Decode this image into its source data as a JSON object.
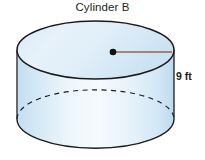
{
  "figure": {
    "title": "Cylinder B",
    "shape": "cylinder",
    "height_label": "9 ft",
    "radius_line": "radius segment from center of top face to edge",
    "colors": {
      "top_face_fill": "#e4f1f9",
      "body_fill_light": "#f2f9fd",
      "body_fill_edge": "#c3dff1",
      "outline": "#1b1b1b",
      "radius_line": "#9a5f55",
      "center_dot": "#111111",
      "title_text": "#231f20",
      "label_text": "#1a1a1a",
      "background": "#ffffff"
    },
    "geometry": {
      "left_x": 17,
      "right_x": 174,
      "top_ellipse_top_y": 21,
      "top_ellipse_center_y": 50,
      "bottom_ellipse_center_y": 119,
      "bottom_y": 148,
      "ellipse_rx": 78,
      "ellipse_ry": 29,
      "center_dot_x": 113,
      "center_dot_y": 52
    }
  }
}
